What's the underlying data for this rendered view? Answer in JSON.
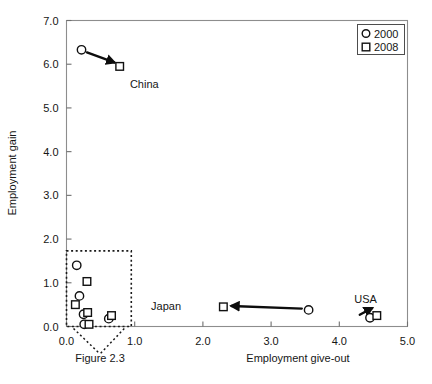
{
  "chart_data": {
    "type": "scatter",
    "title": "",
    "caption": "Figure 2.3",
    "xlabel": "Employment give-out",
    "ylabel": "Employment gain",
    "xlim": [
      0.0,
      5.0
    ],
    "ylim": [
      0.0,
      7.0
    ],
    "xticks": [
      "0.0",
      "1.0",
      "2.0",
      "3.0",
      "4.0",
      "5.0"
    ],
    "xtick_values": [
      0.0,
      1.0,
      2.0,
      3.0,
      4.0,
      5.0
    ],
    "yticks": [
      "0.0",
      "1.0",
      "2.0",
      "3.0",
      "4.0",
      "5.0",
      "6.0",
      "7.0"
    ],
    "ytick_values": [
      0.0,
      1.0,
      2.0,
      3.0,
      4.0,
      5.0,
      6.0,
      7.0
    ],
    "grid": false,
    "legend_position": "top-right",
    "series": [
      {
        "name": "2000",
        "marker": "circle",
        "points": [
          {
            "x": 0.22,
            "y": 6.33
          },
          {
            "x": 0.15,
            "y": 1.4
          },
          {
            "x": 0.19,
            "y": 0.7
          },
          {
            "x": 0.25,
            "y": 0.28
          },
          {
            "x": 0.26,
            "y": 0.05
          },
          {
            "x": 0.62,
            "y": 0.18
          },
          {
            "x": 3.55,
            "y": 0.38
          },
          {
            "x": 4.45,
            "y": 0.2
          }
        ]
      },
      {
        "name": "2008",
        "marker": "square",
        "points": [
          {
            "x": 0.78,
            "y": 5.95
          },
          {
            "x": 0.3,
            "y": 1.03
          },
          {
            "x": 0.13,
            "y": 0.5
          },
          {
            "x": 0.31,
            "y": 0.32
          },
          {
            "x": 0.33,
            "y": 0.05
          },
          {
            "x": 0.66,
            "y": 0.25
          },
          {
            "x": 2.3,
            "y": 0.45
          },
          {
            "x": 4.55,
            "y": 0.25
          }
        ]
      }
    ],
    "annotations": [
      {
        "label": "China",
        "label_x": 0.93,
        "label_y": 5.55,
        "arrow_from": {
          "x": 0.3,
          "y": 6.27
        },
        "arrow_to": {
          "x": 0.7,
          "y": 6.04
        }
      },
      {
        "label": "Japan",
        "label_x": 1.68,
        "label_y": 0.46,
        "arrow_from": {
          "x": 3.45,
          "y": 0.41
        },
        "arrow_to": {
          "x": 2.42,
          "y": 0.47
        }
      },
      {
        "label": "USA",
        "label_x": 4.22,
        "label_y": 0.62,
        "arrow_from": {
          "x": 4.3,
          "y": 0.27
        },
        "arrow_to": {
          "x": 4.48,
          "y": 0.42
        }
      }
    ],
    "callout_region": {
      "x0": 0.0,
      "x1": 0.95,
      "y0": 0.0,
      "y1": 1.73,
      "style": "dotted-rectangle"
    }
  },
  "legend": {
    "entries": [
      {
        "label": "2000",
        "marker": "circle"
      },
      {
        "label": "2008",
        "marker": "square"
      }
    ]
  },
  "colors": {
    "background": "#ffffff",
    "ink": "#111111",
    "frame": "#8d8d8d",
    "marker_fill": "#ffffff"
  }
}
